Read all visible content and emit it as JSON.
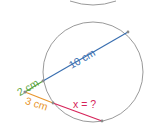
{
  "diagram": {
    "labels": {
      "diameter": "10 cm",
      "external_secant_outer": "2 cm",
      "second_external": "3 cm",
      "unknown": "x = ?"
    },
    "colors": {
      "circle": "#9a9a9a",
      "diameter": "#3a6fb0",
      "external_outer": "#5aa33c",
      "second_external": "#e8962e",
      "unknown": "#d6245a",
      "point": "#8a8a8a"
    }
  }
}
